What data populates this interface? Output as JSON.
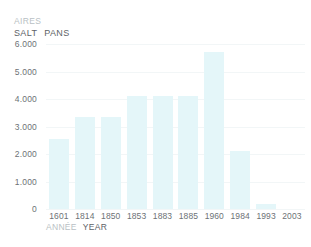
{
  "title": {
    "line_fr": "AIRES",
    "line_en": "SALT  PANS",
    "line_en_fr_part": "SALT",
    "line_en_en_part": "PANS"
  },
  "axes": {
    "x_title_fr": "ANNÉE",
    "x_title_en": "YEAR",
    "y_ticks": [
      "6.000",
      "5.000",
      "4.000",
      "3.000",
      "2.000",
      "1.000",
      "0"
    ]
  },
  "colors": {
    "bar_fill": "#e4f6f9",
    "gridline": "#f2f6f7",
    "label_primary": "#6d7276",
    "label_secondary": "#b9bfc4",
    "background": "#ffffff"
  },
  "chart_data": {
    "type": "bar",
    "xlabel": "ANNÉE YEAR",
    "ylabel": "",
    "categories": [
      "1601",
      "1814",
      "1850",
      "1853",
      "1883",
      "1885",
      "1960",
      "1984",
      "1993",
      "2003"
    ],
    "values": [
      2550,
      3350,
      3350,
      4100,
      4100,
      4100,
      5700,
      2100,
      200,
      0
    ],
    "ylim": [
      0,
      6000
    ],
    "ytick_values": [
      6000,
      5000,
      4000,
      3000,
      2000,
      1000,
      0
    ],
    "grid": true,
    "legend": "none"
  }
}
